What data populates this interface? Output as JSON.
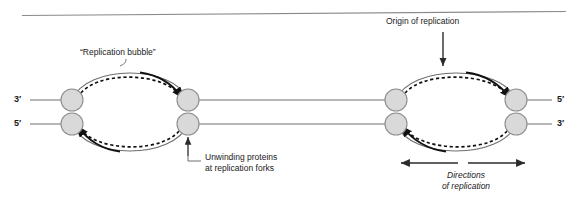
{
  "figure": {
    "title_rule": "top-divider",
    "colors": {
      "stroke": "#58585a",
      "dark_stroke": "#111111",
      "circle_fill": "#d9d9d9",
      "circle_stroke": "#808080",
      "text": "#1a1a1a",
      "background": "#ffffff"
    }
  },
  "labels": {
    "replication_bubble": "“Replication bubble”",
    "origin_of_replication": "Origin of replication",
    "unwinding_line1": "Unwinding proteins",
    "unwinding_line2": "at replication forks",
    "directions_line1": "Directions",
    "directions_line2": "of replication",
    "left_top_prime": "3′",
    "left_bottom_prime": "5′",
    "right_top_prime": "5′",
    "right_bottom_prime": "3′"
  },
  "diagram": {
    "bubbles": [
      {
        "name": "left-replication-bubble",
        "left_fork_x": 72,
        "right_fork_x": 188,
        "top_circle_y": 100,
        "bottom_circle_y": 124
      },
      {
        "name": "right-replication-bubble",
        "left_fork_x": 396,
        "right_fork_x": 516,
        "top_circle_y": 100,
        "bottom_circle_y": 124
      }
    ],
    "circle_radius": 11,
    "strand_connections": 2
  }
}
